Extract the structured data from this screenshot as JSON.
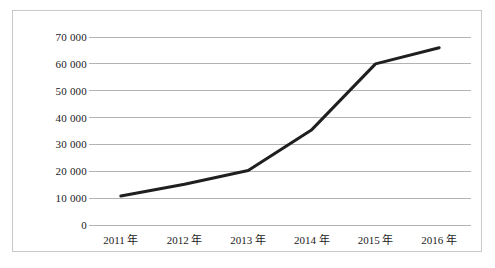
{
  "chart_data": {
    "type": "line",
    "title": "",
    "subtitle": "",
    "xlabel": "",
    "ylabel": "",
    "categories": [
      "2011 年",
      "2012 年",
      "2013 年",
      "2014 年",
      "2015 年",
      "2016 年"
    ],
    "x": [
      2011,
      2012,
      2013,
      2014,
      2015,
      2016
    ],
    "values": [
      10800,
      15200,
      20300,
      35500,
      60000,
      66000
    ],
    "series": [
      {
        "name": "",
        "values": [
          10800,
          15200,
          20300,
          35500,
          60000,
          66000
        ]
      }
    ],
    "ylim": [
      0,
      70000
    ],
    "ytick_values": [
      0,
      10000,
      20000,
      30000,
      40000,
      50000,
      60000,
      70000
    ],
    "ytick_labels": [
      "0",
      "10 000",
      "20 000",
      "30 000",
      "40 000",
      "50 000",
      "60 000",
      "70 000"
    ],
    "grid": true,
    "grid_axis": "y",
    "legend": false,
    "legend_position": "none",
    "line_color": "#1f1f1f",
    "line_width_px": 3,
    "grid_color": "#b3b3b3",
    "border_color": "#c9c9c9",
    "markers": false,
    "annotations": []
  }
}
